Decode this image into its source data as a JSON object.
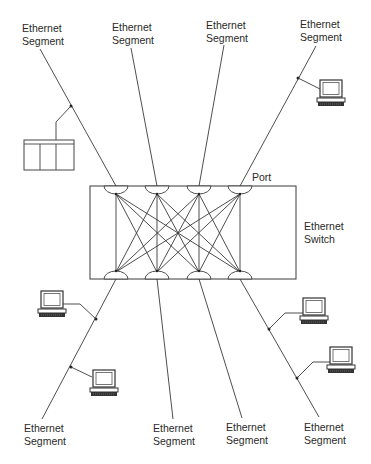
{
  "diagram": {
    "switch": {
      "label_line1": "Ethernet",
      "label_line2": "Switch",
      "port_label": "Port",
      "box": {
        "x": 90,
        "y": 186,
        "w": 206,
        "h": 93
      },
      "top_ports_x": [
        116,
        157,
        199,
        240
      ],
      "bottom_ports_x": [
        116,
        157,
        199,
        240
      ]
    },
    "segments": {
      "top": [
        {
          "line1": "Ethernet",
          "line2": "Segment",
          "device": "panel-device"
        },
        {
          "line1": "Ethernet",
          "line2": "Segment",
          "device": "none"
        },
        {
          "line1": "Ethernet",
          "line2": "Segment",
          "device": "none"
        },
        {
          "line1": "Ethernet",
          "line2": "Segment",
          "device": "computer"
        }
      ],
      "bottom": [
        {
          "line1": "Ethernet",
          "line2": "Segment",
          "device": "2 computers"
        },
        {
          "line1": "Ethernet",
          "line2": "Segment",
          "device": "none"
        },
        {
          "line1": "Ethernet",
          "line2": "Segment",
          "device": "none"
        },
        {
          "line1": "Ethernet",
          "line2": "Segment",
          "device": "2 computers"
        }
      ]
    },
    "icons": [
      "computer-icon",
      "panel-device-icon",
      "port-icon"
    ],
    "colors": {
      "line": "#3a3a3a",
      "text": "#2a2a2a",
      "background": "#ffffff"
    }
  }
}
